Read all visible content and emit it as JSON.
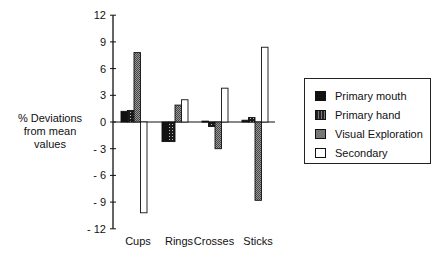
{
  "chart_data": {
    "type": "bar",
    "title": "",
    "xlabel": "",
    "ylabel": "% Deviations from mean values",
    "ylabel_lines": [
      "% Deviations",
      "from mean",
      "values"
    ],
    "categories": [
      "Cups",
      "Rings",
      "Crosses",
      "Sticks"
    ],
    "series": [
      {
        "name": "Primary mouth",
        "values": [
          1.2,
          -2.2,
          0.1,
          0.2
        ],
        "fill": "#111111"
      },
      {
        "name": "Primary hand",
        "values": [
          1.3,
          -2.2,
          -0.5,
          0.5
        ],
        "fill": "#3a3a3a"
      },
      {
        "name": "Visual Exploration",
        "values": [
          7.8,
          1.9,
          -3.0,
          -8.8
        ],
        "fill": "#8a8a8a"
      },
      {
        "name": "Secondary",
        "values": [
          -10.2,
          2.5,
          3.8,
          8.4
        ],
        "fill": "#ffffff"
      }
    ],
    "ylim": [
      -12,
      12
    ],
    "yticks": [
      12,
      9,
      6,
      3,
      0,
      -3,
      -6,
      -9,
      -12
    ],
    "grid": false,
    "legend_position": "right"
  },
  "legend": {
    "items": [
      "Primary mouth",
      "Primary hand",
      "Visual Exploration",
      "Secondary"
    ]
  }
}
